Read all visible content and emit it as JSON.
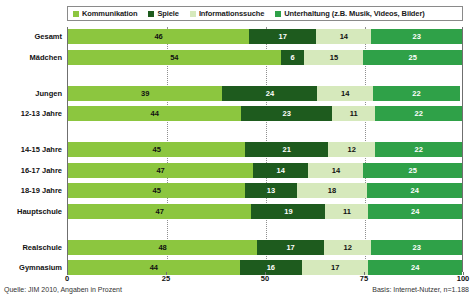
{
  "chart_data": {
    "type": "bar",
    "orientation": "horizontal",
    "stacked": true,
    "title": "",
    "xlabel": "",
    "ylabel": "",
    "xlim": [
      0,
      100
    ],
    "xticks": [
      "0",
      "25",
      "50",
      "75",
      "100"
    ],
    "xtick_values": [
      0,
      25,
      50,
      75,
      100
    ],
    "grid": "vertical-dotted",
    "legend_position": "top",
    "categories": [
      "Gesamt",
      "Mädchen",
      "Jungen",
      "12-13 Jahre",
      "14-15 Jahre",
      "16-17 Jahre",
      "18-19 Jahre",
      "Hauptschule",
      "Realschule",
      "Gymnasium"
    ],
    "series": [
      {
        "name": "Kommunikation",
        "color": "#8CC63F",
        "values": [
          46,
          54,
          39,
          44,
          45,
          47,
          45,
          47,
          48,
          44
        ]
      },
      {
        "name": "Spiele",
        "color": "#1E5B1E",
        "values": [
          17,
          6,
          24,
          23,
          21,
          14,
          13,
          19,
          17,
          16
        ]
      },
      {
        "name": "Informationssuche",
        "color": "#D6E9BC",
        "values": [
          14,
          15,
          14,
          11,
          12,
          14,
          18,
          11,
          12,
          17
        ]
      },
      {
        "name": "Unterhaltung (z.B. Musik, Videos, Bilder)",
        "color": "#2FA148",
        "values": [
          23,
          25,
          22,
          22,
          22,
          25,
          24,
          24,
          23,
          24
        ]
      }
    ],
    "group_breaks": [
      1,
      3,
      7
    ],
    "source_note": "Quelle: JIM 2010, Angaben in Prozent",
    "basis_note": "Basis: Internet-Nutzer, n=1.188"
  },
  "legend": {
    "items": [
      {
        "label": "Kommunikation",
        "color": "#8CC63F"
      },
      {
        "label": "Spiele",
        "color": "#1E5B1E"
      },
      {
        "label": "Informationssuche",
        "color": "#D6E9BC"
      },
      {
        "label": "Unterhaltung (z.B. Musik, Videos, Bilder)",
        "color": "#2FA148"
      }
    ]
  },
  "footer": {
    "left": "Quelle: JIM 2010, Angaben in Prozent",
    "right": "Basis: Internet-Nutzer, n=1.188"
  }
}
